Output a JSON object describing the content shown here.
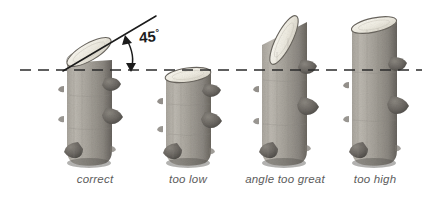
{
  "figure": {
    "kind": "pencil-illustration",
    "background_color": "#ffffff"
  },
  "annotation": {
    "angle_value": "45",
    "degree_symbol": "°",
    "arrow_name": "double-headed-curved-arrow"
  },
  "reference_line": {
    "name": "horizontal-dashed-reference-line",
    "color": "#2b2b2b"
  },
  "cut_line": {
    "name": "angled-cut-guide-line",
    "color": "#1b1b1b"
  },
  "colors": {
    "bark_light": "#b9b5ad",
    "bark_mid": "#9d9890",
    "bark_dark": "#6e6a64",
    "bark_shadow": "#4d4a46",
    "cut_face": "#f4f1e8",
    "cut_face_edge": "#6a665f",
    "caption_text": "#5c5c5c",
    "ink": "#1b1b1b"
  },
  "specimens": [
    {
      "id": "specimen-1",
      "caption": "correct",
      "caption_x": 95,
      "cut_angle_degrees": 45,
      "cut_top_relative_to_line": "at-line"
    },
    {
      "id": "specimen-2",
      "caption": "too low",
      "caption_x": 188,
      "cut_angle_degrees": 15,
      "cut_top_relative_to_line": "below-line"
    },
    {
      "id": "specimen-3",
      "caption": "angle too great",
      "caption_x": 285,
      "cut_angle_degrees": 70,
      "cut_top_relative_to_line": "above-line"
    },
    {
      "id": "specimen-4",
      "caption": "too high",
      "caption_x": 375,
      "cut_angle_degrees": 20,
      "cut_top_relative_to_line": "far-above-line"
    }
  ]
}
